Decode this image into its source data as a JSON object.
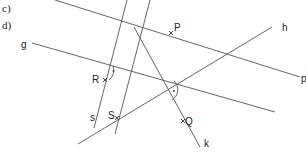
{
  "tasks": [
    {
      "label": "c)"
    },
    {
      "label": "d)"
    }
  ],
  "lines": {
    "g": {
      "label": "g"
    },
    "h": {
      "label": "h"
    },
    "p": {
      "label": "p"
    },
    "s": {
      "label": "s"
    },
    "k": {
      "label": "k"
    }
  },
  "points": {
    "P": {
      "label": "P"
    },
    "R": {
      "label": "R"
    },
    "S": {
      "label": "S"
    },
    "Q": {
      "label": "Q"
    }
  },
  "colors": {
    "line": "#555555",
    "text": "#222222"
  }
}
